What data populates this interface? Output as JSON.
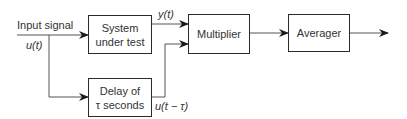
{
  "diagram": {
    "input": {
      "label": "Input signal",
      "signal": "u(t)"
    },
    "blocks": [
      {
        "id": "system",
        "label_line1": "System",
        "label_line2": "under test"
      },
      {
        "id": "delay",
        "label_line1": "Delay of",
        "label_line2": "τ seconds"
      },
      {
        "id": "multiplier",
        "label": "Multiplier"
      },
      {
        "id": "averager",
        "label": "Averager"
      }
    ],
    "signals": {
      "system_output": "y(t)",
      "delay_output": "u(t − τ)"
    },
    "colors": {
      "line": "#2a2a2a",
      "text": "#333333",
      "background": "#ffffff"
    }
  }
}
